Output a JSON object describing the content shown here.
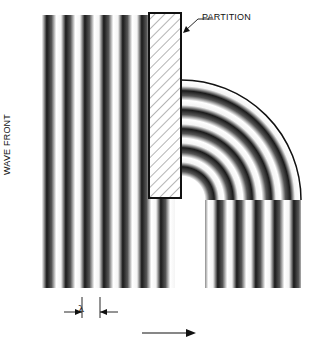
{
  "diagram": {
    "labels": {
      "partition": "PARTITION",
      "wave_front": "WAVE FRONT",
      "wavelength": "λ"
    },
    "colors": {
      "stripe_dark": "#111111",
      "stripe_light": "#ffffff",
      "outline": "#111111",
      "background": "#ffffff"
    },
    "geometry": {
      "wavelength_px": 19,
      "plane_wave_region": {
        "x": 42,
        "y": 15,
        "width": 133,
        "height": 273
      },
      "partition_box": {
        "x": 149,
        "y": 13,
        "width": 32,
        "height": 185
      },
      "quarter_circle_center": {
        "x": 181,
        "y": 200
      },
      "quarter_circle_outer_radius": 120,
      "quarter_circle_inner_radius": 24,
      "lower_vertical_region": {
        "x": 205,
        "y": 200,
        "width": 96,
        "height": 88
      },
      "direction_arrow": {
        "x1": 142,
        "y1": 333,
        "x2": 195,
        "y2": 333
      }
    }
  }
}
